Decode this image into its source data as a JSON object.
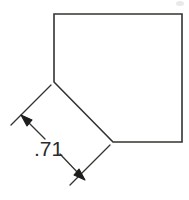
{
  "drawing": {
    "type": "engineering-dimension-drawing",
    "canvas": {
      "width": 189,
      "height": 200,
      "background": "#ffffff"
    },
    "line_color": "#33332f",
    "line_width": 1.6,
    "text_color": "#2b2b2b",
    "part_outline": {
      "name": "chamfered-square",
      "points": "54,14 182,14 182,142 113,142 54,82",
      "closed": true,
      "vertices": [
        {
          "label": "top-left",
          "x": 54,
          "y": 14
        },
        {
          "label": "top-right",
          "x": 182,
          "y": 14
        },
        {
          "label": "bottom-right",
          "x": 182,
          "y": 142
        },
        {
          "label": "chamfer-lower-end",
          "x": 113,
          "y": 142
        },
        {
          "label": "chamfer-upper-end",
          "x": 54,
          "y": 82
        }
      ]
    },
    "dimension": {
      "value": ".71",
      "measures": "chamfer-edge-length",
      "text_x": 34,
      "text_y": 139,
      "extension_line_upper": {
        "x1": 51,
        "y1": 85,
        "x2": 11,
        "y2": 125
      },
      "extension_line_lower": {
        "x1": 110,
        "y1": 145,
        "x2": 70,
        "y2": 185
      },
      "dim_line_upper_seg": {
        "x1": 21,
        "y1": 115,
        "x2": 45,
        "y2": 139
      },
      "dim_line_lower_seg": {
        "x1": 60,
        "y1": 155,
        "x2": 85,
        "y2": 180
      },
      "arrowhead_upper": {
        "x": 24,
        "y": 118,
        "angle_deg": 45
      },
      "arrowhead_lower": {
        "x": 82,
        "y": 177,
        "angle_deg": 225
      }
    },
    "artifacts": [
      {
        "name": "scan-speck-top-right",
        "x": 176,
        "y": 1,
        "w": 8,
        "h": 5
      }
    ]
  }
}
